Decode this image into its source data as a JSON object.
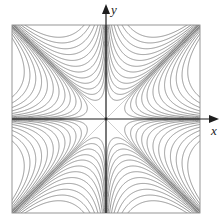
{
  "diagram": {
    "title": "",
    "axes": {
      "x_label": "x",
      "y_label": "y",
      "center_px": [
        106,
        119
      ],
      "half_size_px": 94
    },
    "box": {
      "left": 12,
      "top": 25,
      "right": 200,
      "bottom": 213
    },
    "colors": {
      "curve": "#7a7a7a",
      "axis": "#1e1e1e",
      "diagonal": "#c4c4c4",
      "box": "#8a8a8a"
    },
    "levels": [
      0.0006,
      0.0018,
      0.004,
      0.008,
      0.014,
      0.024,
      0.038,
      0.058,
      0.085,
      0.12,
      0.165,
      0.22
    ]
  }
}
